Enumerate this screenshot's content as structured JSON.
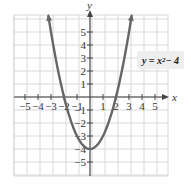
{
  "chart_data": {
    "type": "line",
    "title": "",
    "xlabel": "x",
    "ylabel": "y",
    "xlim": [
      -5.85,
      6
    ],
    "ylim": [
      -6,
      6.3
    ],
    "grid": true,
    "x_ticks": [
      -5,
      -4,
      -3,
      -2,
      -1,
      1,
      2,
      3,
      4,
      5
    ],
    "y_ticks": [
      -5,
      -4,
      -3,
      -2,
      -1,
      1,
      2,
      3,
      4,
      5
    ],
    "x_tick_labels": [
      "−5",
      "−4",
      "−3",
      "−2",
      "−1",
      "1",
      "2",
      "3",
      "4",
      "5"
    ],
    "y_tick_labels": [
      "−5",
      "−4",
      "−3",
      "−2",
      "−1",
      "1",
      "2",
      "3",
      "4",
      "5"
    ],
    "series": [
      {
        "name": "y = x² − 4",
        "function": "x^2 - 4",
        "x": [
          -3.2,
          -3,
          -2,
          -1,
          0,
          1,
          2,
          3,
          3.2
        ],
        "y": [
          6.24,
          5,
          0,
          -3,
          -4,
          -3,
          0,
          5,
          6.24
        ],
        "color": "#666666"
      }
    ],
    "annotations": [
      {
        "text": "y = x² − 4",
        "position": "right of upper-right branch"
      }
    ],
    "key_points": {
      "vertex": [
        0,
        -4
      ],
      "x_intercepts": [
        [
          -2,
          0
        ],
        [
          2,
          0
        ]
      ]
    }
  },
  "labels": {
    "x_axis": "x",
    "y_axis": "y",
    "equation_prefix": "y = x",
    "equation_exp": "2",
    "equation_suffix": " − 4"
  },
  "colors": {
    "curve": "#666666",
    "axis": "#444444",
    "grid": "#d8d8d8",
    "label_bg": "#eeeeee"
  }
}
